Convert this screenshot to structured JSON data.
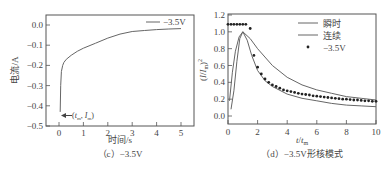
{
  "chart_data": [
    {
      "type": "line",
      "title": "",
      "caption": "（c）−3.5V",
      "xlabel": "时间/s",
      "ylabel": "电流/A",
      "xlim": [
        -0.4,
        5.5
      ],
      "ylim": [
        -0.5,
        0.05
      ],
      "xticks": [
        "0",
        "1",
        "2",
        "3",
        "4",
        "5"
      ],
      "yticks": [
        "0.0",
        "−0.1",
        "−0.2",
        "−0.3",
        "−0.4",
        "−0.5"
      ],
      "legend": [
        "−3.5V"
      ],
      "legend_position": "upper right",
      "annotation": "(t_m, I_m)",
      "series": [
        {
          "name": "−3.5V",
          "x": [
            0.05,
            0.07,
            0.1,
            0.15,
            0.2,
            0.3,
            0.5,
            0.75,
            1.0,
            1.5,
            2.0,
            2.5,
            3.0,
            3.5,
            4.0,
            4.5,
            5.0
          ],
          "y": [
            -0.43,
            -0.3,
            -0.23,
            -0.2,
            -0.185,
            -0.17,
            -0.15,
            -0.13,
            -0.115,
            -0.09,
            -0.065,
            -0.045,
            -0.032,
            -0.027,
            -0.023,
            -0.02,
            -0.018
          ]
        }
      ]
    },
    {
      "type": "line",
      "title": "",
      "caption": "（d）−3.5V形核模式",
      "xlabel": "t/t_m",
      "ylabel": "(I/I_m)^2",
      "xlim": [
        0,
        10
      ],
      "ylim": [
        -0.1,
        1.2
      ],
      "xticks": [
        "0",
        "2",
        "4",
        "6",
        "8",
        "10"
      ],
      "yticks": [
        "0.0",
        "0.2",
        "0.4",
        "0.6",
        "0.8",
        "1.0",
        "1.2"
      ],
      "legend": [
        "瞬时",
        "连续",
        "−3.5V"
      ],
      "legend_position": "upper right",
      "series": [
        {
          "name": "瞬时",
          "x": [
            0.1,
            0.3,
            0.5,
            0.75,
            1.0,
            1.5,
            2.0,
            3.0,
            4.0,
            5.0,
            6.0,
            7.0,
            8.0,
            9.0,
            10.0
          ],
          "y": [
            0.18,
            0.52,
            0.77,
            0.94,
            1.0,
            0.92,
            0.8,
            0.6,
            0.46,
            0.37,
            0.31,
            0.27,
            0.23,
            0.21,
            0.19
          ]
        },
        {
          "name": "连续",
          "x": [
            0.2,
            0.4,
            0.6,
            0.8,
            1.0,
            1.3,
            1.6,
            2.0,
            2.5,
            3.0,
            4.0,
            5.0,
            6.0,
            7.0,
            8.0,
            9.0,
            10.0
          ],
          "y": [
            0.08,
            0.3,
            0.65,
            0.92,
            1.0,
            0.9,
            0.72,
            0.54,
            0.42,
            0.35,
            0.26,
            0.21,
            0.18,
            0.15,
            0.13,
            0.12,
            0.11
          ]
        },
        {
          "name": "−3.5V",
          "x": [
            0.0,
            0.2,
            0.4,
            0.6,
            0.8,
            1.0,
            1.2,
            1.5,
            1.75,
            2.0,
            2.25,
            2.5,
            2.75,
            3.0,
            3.25,
            3.5,
            3.75,
            4.0,
            4.25,
            4.5,
            4.75,
            5.0,
            5.25,
            5.5,
            5.75,
            6.0,
            6.25,
            6.5,
            6.75,
            7.0,
            7.25,
            7.5,
            7.75,
            8.0,
            8.25,
            8.5,
            8.75,
            9.0,
            9.25,
            9.5,
            9.75,
            10.0
          ],
          "y": [
            1.09,
            1.09,
            1.09,
            1.09,
            1.09,
            1.09,
            1.09,
            1.04,
            0.72,
            0.58,
            0.5,
            0.44,
            0.4,
            0.37,
            0.35,
            0.33,
            0.31,
            0.3,
            0.29,
            0.28,
            0.27,
            0.26,
            0.255,
            0.25,
            0.24,
            0.235,
            0.23,
            0.225,
            0.22,
            0.215,
            0.21,
            0.205,
            0.2,
            0.2,
            0.195,
            0.19,
            0.19,
            0.185,
            0.18,
            0.18,
            0.175,
            0.175
          ]
        }
      ]
    }
  ]
}
